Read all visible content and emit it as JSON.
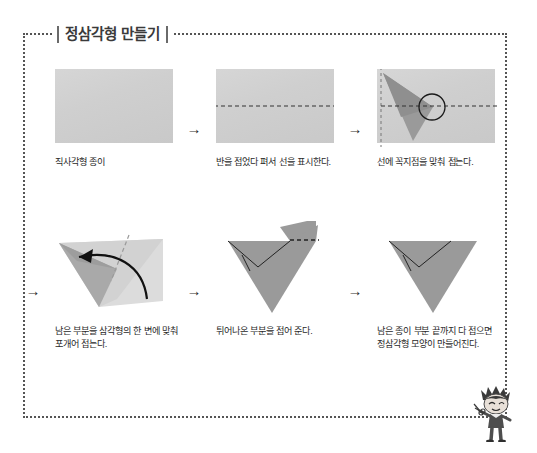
{
  "page": {
    "title": "정삼각형 만들기",
    "border_color": "#555555",
    "paper_color": "#cfcfcf",
    "fold_color": "#8d8d8d",
    "background": "#ffffff"
  },
  "steps": [
    {
      "index": "1",
      "arrow": "",
      "caption": "직사각형 종이",
      "figure": "plain-rectangle"
    },
    {
      "index": "2",
      "arrow": "→",
      "caption": "반을 접었다 펴서 선을 표시한다.",
      "figure": "rectangle-with-center-crease"
    },
    {
      "index": "3",
      "arrow": "→",
      "caption": "선에 꼭지점을 맞춰 접는다.",
      "figure": "corner-folded-to-crease"
    },
    {
      "index": "4",
      "arrow": "→",
      "caption": "남은 부분을 삼각형의 한 변에 맞춰\n포개어 접는다.",
      "figure": "fold-remaining-with-arrow"
    },
    {
      "index": "5",
      "arrow": "→",
      "caption": "튀어나온 부분을 접어 준다.",
      "figure": "triangle-with-flap"
    },
    {
      "index": "6",
      "arrow": "→",
      "caption": "남은 종이 부분 끝까지 다 접으면\n정삼각형 모양이 만들어진다.",
      "figure": "finished-equilateral-triangle"
    }
  ],
  "mascot": {
    "name": "cartoon-boy-with-scissors"
  }
}
